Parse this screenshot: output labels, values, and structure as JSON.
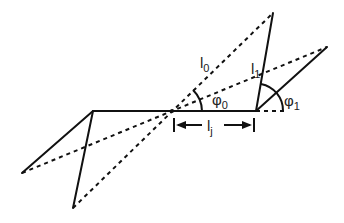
{
  "diagram": {
    "labels": {
      "l0": {
        "main": "l",
        "sub": "0"
      },
      "l1": {
        "main": "l",
        "sub": "1"
      },
      "lj": {
        "main": "l",
        "sub": "j"
      },
      "phi0": {
        "main": "φ",
        "sub": "0"
      },
      "phi1": {
        "main": "φ",
        "sub": "1"
      }
    },
    "colors": {
      "line": "#111111",
      "background": "#ffffff"
    }
  }
}
